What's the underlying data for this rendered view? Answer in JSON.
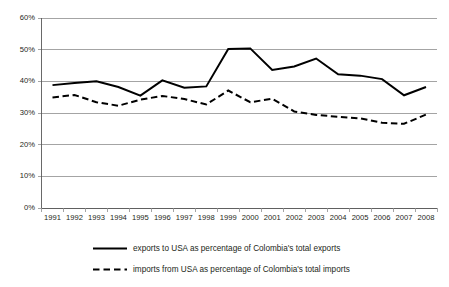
{
  "chart_data": {
    "type": "line",
    "title": "",
    "subtitle": "",
    "xlabel": "",
    "ylabel": "",
    "categories": [
      "1991",
      "1992",
      "1993",
      "1994",
      "1995",
      "1996",
      "1997",
      "1998",
      "1999",
      "2000",
      "2001",
      "2002",
      "2003",
      "2004",
      "2005",
      "2006",
      "2007",
      "2008"
    ],
    "x": [
      1991,
      1992,
      1993,
      1994,
      1995,
      1996,
      1997,
      1998,
      1999,
      2000,
      2001,
      2002,
      2003,
      2004,
      2005,
      2006,
      2007,
      2008
    ],
    "series": [
      {
        "name": "exports to USA as percentage of Colombia's total exports",
        "style": "solid",
        "color": "#000000",
        "values": [
          38.8,
          39.5,
          40.0,
          38.2,
          35.5,
          40.3,
          38.0,
          38.4,
          50.2,
          50.4,
          43.6,
          44.7,
          47.2,
          42.2,
          41.8,
          40.7,
          35.6,
          38.2
        ]
      },
      {
        "name": "imports from USA as percentage of Colombia's total imports",
        "style": "dashed",
        "color": "#000000",
        "values": [
          34.9,
          35.7,
          33.4,
          32.3,
          34.2,
          35.4,
          34.4,
          32.7,
          37.1,
          33.4,
          34.5,
          30.5,
          29.4,
          28.8,
          28.3,
          26.9,
          26.6,
          29.5
        ]
      }
    ],
    "ylim": [
      0,
      60
    ],
    "ytick_values": [
      0,
      10,
      20,
      30,
      40,
      50,
      60
    ],
    "ytick_labels": [
      "0%",
      "10%",
      "20%",
      "30%",
      "40%",
      "50%",
      "60%"
    ],
    "grid": true,
    "grid_axis": "y",
    "legend_position": "bottom",
    "legend": [
      "exports to USA as percentage of Colombia's total exports",
      "imports from USA as percentage of Colombia's total imports"
    ]
  }
}
